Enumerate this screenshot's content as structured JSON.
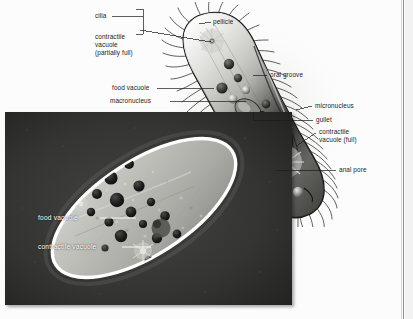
{
  "figure": {
    "kind": "biology-textbook-figure",
    "organism": "Paramecium",
    "panels": [
      {
        "name": "illustration",
        "description": "labeled line drawing of a paramecium, shaded grayscale, tilted diagonally, fringed with cilia"
      },
      {
        "name": "micrograph",
        "description": "dark-field light micrograph of a living paramecium with bright outline and dark food vacuoles"
      }
    ]
  },
  "illustration_labels": {
    "cilia": "cilia",
    "contractile_vacuole_partial_line1": "contractile",
    "contractile_vacuole_partial_line2": "vacuole",
    "contractile_vacuole_partial_line3": "(partially full)",
    "food_vacuole": "food vacuole",
    "macronucleus": "macronucleus",
    "pellicle": "pellicle",
    "oral_groove": "oral groove",
    "micronucleus": "micronucleus",
    "gullet": "gullet",
    "contractile_vacuole_full_line1": "contractile",
    "contractile_vacuole_full_line2": "vacuole (full)",
    "anal_pore": "anal pore"
  },
  "micrograph_labels": {
    "food_vacuole": "food vacuole",
    "contractile_vacuole": "contractile vacuole"
  },
  "colors": {
    "page_background": "#fcfcfc",
    "label_text": "#1b1b1b",
    "photo_label_text": "#ffffff",
    "leader_line": "#1b1b1b",
    "cell_outline": "#151515",
    "cell_fill_light": "#e9e9e6",
    "cell_fill_mid": "#9a9a96",
    "cell_fill_dark": "#5a5a58",
    "photo_background": "#2e2e2e",
    "photo_cell_body": "#b9b9b4",
    "photo_rim": "#ffffff",
    "photo_vacuole": "#141414",
    "page_border": "#8e8e8e"
  }
}
